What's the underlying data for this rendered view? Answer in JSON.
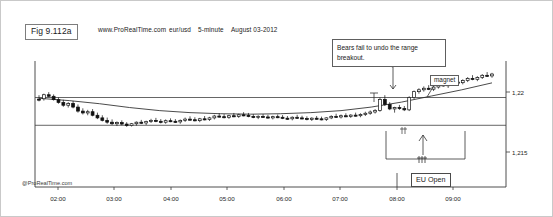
{
  "figure": {
    "tag": "Fig 9.112a",
    "watermark": "@ProRealTime.com"
  },
  "header": {
    "site": "www.ProRealTime.com",
    "symbol": "eur/usd",
    "timeframe": "5-minute",
    "date": "August 03-2012"
  },
  "annotations": {
    "note": "Bears fail to undo the range breakout.",
    "magnet": "magnet",
    "eu_open": "EU Open"
  },
  "chart_data": {
    "type": "line",
    "title": "eur/usd 5-minute August 03-2012",
    "subtitle": "www.ProRealTime.com",
    "xlabel": "",
    "ylabel": "",
    "grid": false,
    "legend_position": "none",
    "xticks": [
      "02:00",
      "03:00",
      "04:00",
      "05:00",
      "06:00",
      "07:00",
      "08:00",
      "09:00"
    ],
    "yticks": [
      "1,22",
      "1,215"
    ],
    "ylim": [
      1.2138,
      1.2208
    ],
    "range_lines": [
      1.2196,
      1.2178
    ],
    "annotations": [
      {
        "text": "Bears fail to undo the range breakout.",
        "at_time": "07:50"
      },
      {
        "text": "magnet",
        "at_time": "08:35"
      },
      {
        "text": "EU Open",
        "at_time": "08:00"
      }
    ],
    "ma_series": {
      "name": "moving average",
      "x": [
        "02:00",
        "02:30",
        "03:00",
        "03:30",
        "04:00",
        "04:30",
        "05:00",
        "05:30",
        "06:00",
        "06:30",
        "07:00",
        "07:30",
        "08:00",
        "08:30",
        "09:00",
        "09:30"
      ],
      "values": [
        1.21955,
        1.2194,
        1.2192,
        1.21895,
        1.21875,
        1.21862,
        1.21855,
        1.21852,
        1.21855,
        1.21862,
        1.21875,
        1.21898,
        1.2193,
        1.2197,
        1.2201,
        1.22055
      ]
    },
    "ohlc": [
      {
        "t": "01:35",
        "o": 1.2195,
        "h": 1.21975,
        "l": 1.21935,
        "c": 1.21945,
        "up": false
      },
      {
        "t": "01:40",
        "o": 1.21952,
        "h": 1.21985,
        "l": 1.2194,
        "c": 1.21978,
        "up": true
      },
      {
        "t": "01:45",
        "o": 1.21978,
        "h": 1.21995,
        "l": 1.21962,
        "c": 1.21968,
        "up": false
      },
      {
        "t": "01:50",
        "o": 1.21968,
        "h": 1.2198,
        "l": 1.2194,
        "c": 1.21946,
        "up": false
      },
      {
        "t": "01:55",
        "o": 1.21946,
        "h": 1.2196,
        "l": 1.2192,
        "c": 1.21928,
        "up": false
      },
      {
        "t": "02:00",
        "o": 1.21928,
        "h": 1.21945,
        "l": 1.219,
        "c": 1.2191,
        "up": false
      },
      {
        "t": "02:05",
        "o": 1.2191,
        "h": 1.2193,
        "l": 1.21895,
        "c": 1.21922,
        "up": true
      },
      {
        "t": "02:10",
        "o": 1.21922,
        "h": 1.21938,
        "l": 1.2189,
        "c": 1.21898,
        "up": false
      },
      {
        "t": "02:15",
        "o": 1.21898,
        "h": 1.21915,
        "l": 1.21862,
        "c": 1.21872,
        "up": false
      },
      {
        "t": "02:20",
        "o": 1.21872,
        "h": 1.2189,
        "l": 1.2185,
        "c": 1.2186,
        "up": false
      },
      {
        "t": "02:25",
        "o": 1.2186,
        "h": 1.2188,
        "l": 1.21845,
        "c": 1.21868,
        "up": true
      },
      {
        "t": "02:30",
        "o": 1.21868,
        "h": 1.21885,
        "l": 1.21838,
        "c": 1.21845,
        "up": false
      },
      {
        "t": "02:35",
        "o": 1.21845,
        "h": 1.21862,
        "l": 1.2182,
        "c": 1.21828,
        "up": false
      },
      {
        "t": "02:40",
        "o": 1.21828,
        "h": 1.21845,
        "l": 1.21805,
        "c": 1.21812,
        "up": false
      },
      {
        "t": "02:45",
        "o": 1.21812,
        "h": 1.2183,
        "l": 1.2179,
        "c": 1.218,
        "up": false
      },
      {
        "t": "02:50",
        "o": 1.218,
        "h": 1.21818,
        "l": 1.21782,
        "c": 1.2179,
        "up": false
      },
      {
        "t": "02:55",
        "o": 1.2179,
        "h": 1.21805,
        "l": 1.21775,
        "c": 1.21798,
        "up": true
      },
      {
        "t": "03:00",
        "o": 1.21798,
        "h": 1.21812,
        "l": 1.2178,
        "c": 1.21788,
        "up": false
      },
      {
        "t": "03:05",
        "o": 1.21788,
        "h": 1.218,
        "l": 1.2177,
        "c": 1.21778,
        "up": false
      },
      {
        "t": "03:10",
        "o": 1.21778,
        "h": 1.21795,
        "l": 1.21772,
        "c": 1.2179,
        "up": true
      },
      {
        "t": "03:15",
        "o": 1.2179,
        "h": 1.21805,
        "l": 1.21778,
        "c": 1.218,
        "up": true
      },
      {
        "t": "03:20",
        "o": 1.218,
        "h": 1.21815,
        "l": 1.21788,
        "c": 1.21795,
        "up": false
      },
      {
        "t": "03:25",
        "o": 1.21795,
        "h": 1.2181,
        "l": 1.21782,
        "c": 1.21805,
        "up": true
      },
      {
        "t": "03:30",
        "o": 1.21805,
        "h": 1.21822,
        "l": 1.21795,
        "c": 1.21812,
        "up": true
      },
      {
        "t": "03:35",
        "o": 1.21812,
        "h": 1.21828,
        "l": 1.218,
        "c": 1.21806,
        "up": false
      },
      {
        "t": "03:40",
        "o": 1.21806,
        "h": 1.2182,
        "l": 1.21792,
        "c": 1.218,
        "up": false
      },
      {
        "t": "03:45",
        "o": 1.218,
        "h": 1.21818,
        "l": 1.2179,
        "c": 1.2181,
        "up": true
      },
      {
        "t": "03:50",
        "o": 1.2181,
        "h": 1.21825,
        "l": 1.218,
        "c": 1.21806,
        "up": false
      },
      {
        "t": "03:55",
        "o": 1.21806,
        "h": 1.2182,
        "l": 1.21795,
        "c": 1.21802,
        "up": false
      },
      {
        "t": "04:00",
        "o": 1.21802,
        "h": 1.21818,
        "l": 1.2179,
        "c": 1.21812,
        "up": true
      },
      {
        "t": "04:05",
        "o": 1.21812,
        "h": 1.2183,
        "l": 1.21802,
        "c": 1.2182,
        "up": true
      },
      {
        "t": "04:10",
        "o": 1.2182,
        "h": 1.21838,
        "l": 1.2181,
        "c": 1.21816,
        "up": false
      },
      {
        "t": "04:15",
        "o": 1.21816,
        "h": 1.21832,
        "l": 1.21805,
        "c": 1.2181,
        "up": false
      },
      {
        "t": "04:20",
        "o": 1.2181,
        "h": 1.21828,
        "l": 1.218,
        "c": 1.21822,
        "up": true
      },
      {
        "t": "04:25",
        "o": 1.21822,
        "h": 1.2184,
        "l": 1.21812,
        "c": 1.21818,
        "up": false
      },
      {
        "t": "04:30",
        "o": 1.21818,
        "h": 1.21835,
        "l": 1.21808,
        "c": 1.21828,
        "up": true
      },
      {
        "t": "04:35",
        "o": 1.21828,
        "h": 1.21848,
        "l": 1.21818,
        "c": 1.2184,
        "up": true
      },
      {
        "t": "04:40",
        "o": 1.2184,
        "h": 1.21858,
        "l": 1.2183,
        "c": 1.21836,
        "up": false
      },
      {
        "t": "04:45",
        "o": 1.21836,
        "h": 1.21852,
        "l": 1.21825,
        "c": 1.21832,
        "up": false
      },
      {
        "t": "04:50",
        "o": 1.21832,
        "h": 1.21848,
        "l": 1.21822,
        "c": 1.21842,
        "up": true
      },
      {
        "t": "04:55",
        "o": 1.21842,
        "h": 1.2186,
        "l": 1.21832,
        "c": 1.21838,
        "up": false
      },
      {
        "t": "05:00",
        "o": 1.21838,
        "h": 1.21855,
        "l": 1.21828,
        "c": 1.21848,
        "up": true
      },
      {
        "t": "05:05",
        "o": 1.21848,
        "h": 1.21865,
        "l": 1.21838,
        "c": 1.21844,
        "up": false
      },
      {
        "t": "05:10",
        "o": 1.21844,
        "h": 1.2186,
        "l": 1.21832,
        "c": 1.21838,
        "up": false
      },
      {
        "t": "05:15",
        "o": 1.21838,
        "h": 1.21852,
        "l": 1.21826,
        "c": 1.2183,
        "up": false
      },
      {
        "t": "05:20",
        "o": 1.2183,
        "h": 1.21845,
        "l": 1.2182,
        "c": 1.21838,
        "up": true
      },
      {
        "t": "05:25",
        "o": 1.21838,
        "h": 1.21852,
        "l": 1.21828,
        "c": 1.21834,
        "up": false
      },
      {
        "t": "05:30",
        "o": 1.21834,
        "h": 1.21848,
        "l": 1.21822,
        "c": 1.21828,
        "up": false
      },
      {
        "t": "05:35",
        "o": 1.21828,
        "h": 1.21842,
        "l": 1.21818,
        "c": 1.21836,
        "up": true
      },
      {
        "t": "05:40",
        "o": 1.21836,
        "h": 1.2185,
        "l": 1.21826,
        "c": 1.21832,
        "up": false
      },
      {
        "t": "05:45",
        "o": 1.21832,
        "h": 1.21846,
        "l": 1.2182,
        "c": 1.21826,
        "up": false
      },
      {
        "t": "05:50",
        "o": 1.21826,
        "h": 1.2184,
        "l": 1.21815,
        "c": 1.21822,
        "up": false
      },
      {
        "t": "05:55",
        "o": 1.21822,
        "h": 1.21838,
        "l": 1.21812,
        "c": 1.21832,
        "up": true
      },
      {
        "t": "06:00",
        "o": 1.21832,
        "h": 1.21848,
        "l": 1.21822,
        "c": 1.21828,
        "up": false
      },
      {
        "t": "06:05",
        "o": 1.21828,
        "h": 1.21842,
        "l": 1.21818,
        "c": 1.21824,
        "up": false
      },
      {
        "t": "06:10",
        "o": 1.21824,
        "h": 1.21838,
        "l": 1.21812,
        "c": 1.21818,
        "up": false
      },
      {
        "t": "06:15",
        "o": 1.21818,
        "h": 1.21832,
        "l": 1.21808,
        "c": 1.21826,
        "up": true
      },
      {
        "t": "06:20",
        "o": 1.21826,
        "h": 1.2184,
        "l": 1.21816,
        "c": 1.21822,
        "up": false
      },
      {
        "t": "06:25",
        "o": 1.21822,
        "h": 1.21836,
        "l": 1.21812,
        "c": 1.21818,
        "up": false
      },
      {
        "t": "06:30",
        "o": 1.21818,
        "h": 1.21832,
        "l": 1.21808,
        "c": 1.21828,
        "up": true
      },
      {
        "t": "06:35",
        "o": 1.21828,
        "h": 1.21845,
        "l": 1.2182,
        "c": 1.21838,
        "up": true
      },
      {
        "t": "06:40",
        "o": 1.21838,
        "h": 1.21855,
        "l": 1.21828,
        "c": 1.21834,
        "up": false
      },
      {
        "t": "06:45",
        "o": 1.21834,
        "h": 1.2185,
        "l": 1.21824,
        "c": 1.21842,
        "up": true
      },
      {
        "t": "06:50",
        "o": 1.21842,
        "h": 1.21858,
        "l": 1.21832,
        "c": 1.21838,
        "up": false
      },
      {
        "t": "06:55",
        "o": 1.21838,
        "h": 1.21852,
        "l": 1.21828,
        "c": 1.21846,
        "up": true
      },
      {
        "t": "07:00",
        "o": 1.21846,
        "h": 1.21862,
        "l": 1.21836,
        "c": 1.21842,
        "up": false
      },
      {
        "t": "07:05",
        "o": 1.21842,
        "h": 1.21858,
        "l": 1.21832,
        "c": 1.2185,
        "up": true
      },
      {
        "t": "07:10",
        "o": 1.2185,
        "h": 1.21868,
        "l": 1.2184,
        "c": 1.21858,
        "up": true
      },
      {
        "t": "07:15",
        "o": 1.21858,
        "h": 1.21876,
        "l": 1.21848,
        "c": 1.21866,
        "up": true
      },
      {
        "t": "07:20",
        "o": 1.21866,
        "h": 1.21885,
        "l": 1.21856,
        "c": 1.21876,
        "up": true
      },
      {
        "t": "07:25",
        "o": 1.21876,
        "h": 1.2196,
        "l": 1.21868,
        "c": 1.21948,
        "up": true
      },
      {
        "t": "07:30",
        "o": 1.21948,
        "h": 1.21975,
        "l": 1.21905,
        "c": 1.21915,
        "up": false
      },
      {
        "t": "07:35",
        "o": 1.21915,
        "h": 1.2193,
        "l": 1.21878,
        "c": 1.21886,
        "up": false
      },
      {
        "t": "07:40",
        "o": 1.21886,
        "h": 1.219,
        "l": 1.21862,
        "c": 1.21895,
        "up": true
      },
      {
        "t": "07:45",
        "o": 1.21895,
        "h": 1.21912,
        "l": 1.2188,
        "c": 1.21888,
        "up": false
      },
      {
        "t": "07:50",
        "o": 1.21888,
        "h": 1.21905,
        "l": 1.21872,
        "c": 1.2188,
        "up": false
      },
      {
        "t": "07:55",
        "o": 1.2188,
        "h": 1.21968,
        "l": 1.21872,
        "c": 1.2196,
        "up": true
      },
      {
        "t": "08:00",
        "o": 1.2196,
        "h": 1.22005,
        "l": 1.2195,
        "c": 1.21998,
        "up": true
      },
      {
        "t": "08:05",
        "o": 1.21998,
        "h": 1.2202,
        "l": 1.21985,
        "c": 1.2201,
        "up": true
      },
      {
        "t": "08:10",
        "o": 1.2201,
        "h": 1.22032,
        "l": 1.21998,
        "c": 1.2202,
        "up": true
      },
      {
        "t": "08:15",
        "o": 1.2202,
        "h": 1.2204,
        "l": 1.22008,
        "c": 1.22014,
        "up": false
      },
      {
        "t": "08:20",
        "o": 1.22014,
        "h": 1.22035,
        "l": 1.22002,
        "c": 1.22028,
        "up": true
      },
      {
        "t": "08:25",
        "o": 1.22028,
        "h": 1.22052,
        "l": 1.22018,
        "c": 1.22042,
        "up": true
      },
      {
        "t": "08:30",
        "o": 1.22042,
        "h": 1.22062,
        "l": 1.2203,
        "c": 1.22036,
        "up": false
      },
      {
        "t": "08:35",
        "o": 1.22036,
        "h": 1.22058,
        "l": 1.22022,
        "c": 1.22048,
        "up": true
      },
      {
        "t": "08:40",
        "o": 1.22048,
        "h": 1.2207,
        "l": 1.22038,
        "c": 1.2206,
        "up": true
      },
      {
        "t": "08:45",
        "o": 1.2206,
        "h": 1.22082,
        "l": 1.2205,
        "c": 1.22056,
        "up": false
      },
      {
        "t": "08:50",
        "o": 1.22056,
        "h": 1.22078,
        "l": 1.22045,
        "c": 1.2207,
        "up": true
      },
      {
        "t": "08:55",
        "o": 1.2207,
        "h": 1.22092,
        "l": 1.2206,
        "c": 1.22084,
        "up": true
      },
      {
        "t": "09:00",
        "o": 1.22084,
        "h": 1.22105,
        "l": 1.22072,
        "c": 1.22078,
        "up": false
      },
      {
        "t": "09:05",
        "o": 1.22078,
        "h": 1.22098,
        "l": 1.22066,
        "c": 1.2209,
        "up": true
      },
      {
        "t": "09:10",
        "o": 1.2209,
        "h": 1.22112,
        "l": 1.2208,
        "c": 1.22104,
        "up": true
      },
      {
        "t": "09:15",
        "o": 1.22104,
        "h": 1.22125,
        "l": 1.22094,
        "c": 1.221,
        "up": false
      },
      {
        "t": "09:20",
        "o": 1.221,
        "h": 1.2212,
        "l": 1.22088,
        "c": 1.22112,
        "up": true
      }
    ]
  },
  "axis": {
    "x_ticks": [
      {
        "label": "02:00",
        "px": 57
      },
      {
        "label": "03:00",
        "px": 113
      },
      {
        "label": "04:00",
        "px": 170
      },
      {
        "label": "05:00",
        "px": 226
      },
      {
        "label": "06:00",
        "px": 283
      },
      {
        "label": "07:00",
        "px": 339
      },
      {
        "label": "08:00",
        "px": 396
      },
      {
        "label": "09:00",
        "px": 452
      }
    ],
    "y_ticks": [
      {
        "label": "1,22",
        "px": 91
      },
      {
        "label": "1,215",
        "px": 151
      }
    ]
  }
}
